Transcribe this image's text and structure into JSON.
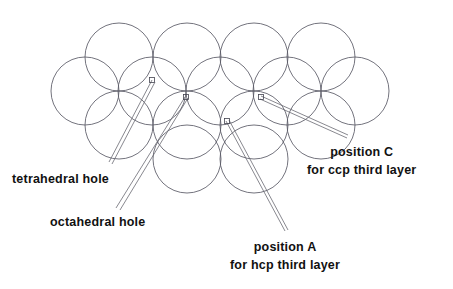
{
  "figure": {
    "width": 453,
    "height": 289,
    "background_color": "#ffffff",
    "circle_stroke_color": "#5a5a66",
    "leader_line_color": "#6a6a72",
    "marker_color": "#444450",
    "text_color": "#111111"
  },
  "labels": {
    "tetrahedral_hole": {
      "line1": "tetrahedral hole",
      "x": 12,
      "y": 170
    },
    "octahedral_hole": {
      "line1": "octahedral hole",
      "x": 50,
      "y": 213
    },
    "position_c": {
      "line1": "position C",
      "line2": "for ccp third layer",
      "x": 307,
      "y": 143
    },
    "position_a": {
      "line1": "position A",
      "line2": "for hcp third layer",
      "x": 230,
      "y": 238
    }
  },
  "markers": [
    {
      "name": "tetrahedral-hole-marker",
      "x": 152,
      "y": 81
    },
    {
      "name": "octahedral-hole-marker",
      "x": 186,
      "y": 97
    },
    {
      "name": "position-c-marker",
      "x": 261,
      "y": 97
    },
    {
      "name": "position-a-marker",
      "x": 227,
      "y": 121
    }
  ],
  "circles": {
    "radius": 34,
    "row1": [
      {
        "cx": 119,
        "cy": 57
      },
      {
        "cx": 187,
        "cy": 57
      },
      {
        "cx": 254,
        "cy": 57
      },
      {
        "cx": 321,
        "cy": 57
      }
    ],
    "row2": [
      {
        "cx": 85,
        "cy": 91
      },
      {
        "cx": 152,
        "cy": 91
      },
      {
        "cx": 220,
        "cy": 91
      },
      {
        "cx": 287,
        "cy": 91
      },
      {
        "cx": 355,
        "cy": 91
      }
    ],
    "row3": [
      {
        "cx": 119,
        "cy": 125
      },
      {
        "cx": 187,
        "cy": 125
      },
      {
        "cx": 254,
        "cy": 125
      },
      {
        "cx": 321,
        "cy": 125
      }
    ],
    "row4": [
      {
        "cx": 187,
        "cy": 159
      },
      {
        "cx": 254,
        "cy": 159
      }
    ]
  },
  "leaders": {
    "tetrahedral": {
      "from_x": 152,
      "from_y": 81,
      "to_x": 110,
      "to_y": 163
    },
    "octahedral": {
      "from_x": 186,
      "from_y": 97,
      "to_x": 118,
      "to_y": 209
    },
    "position_c": {
      "from_x": 261,
      "from_y": 97,
      "to_x": 348,
      "to_y": 137
    },
    "position_a": {
      "from_x": 227,
      "from_y": 121,
      "to_x": 287,
      "to_y": 232
    }
  }
}
